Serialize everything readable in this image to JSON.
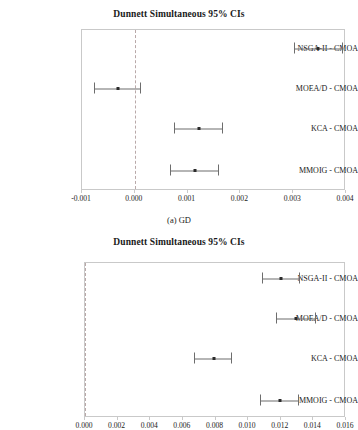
{
  "figures": [
    {
      "id": "gd",
      "title": "Dunnett Simultaneous 95% CIs",
      "caption": "(a) GD",
      "chart_data": {
        "type": "scatter",
        "title": "Dunnett Simultaneous 95% CIs",
        "xlabel": "",
        "ylabel": "",
        "xlim": [
          -0.001,
          0.004
        ],
        "xticks": [
          "-0.001",
          "0.000",
          "0.001",
          "0.002",
          "0.003",
          "0.004"
        ],
        "xtick_values": [
          -0.001,
          0.0,
          0.001,
          0.002,
          0.003,
          0.004
        ],
        "reference_line": 0.0,
        "grid": false,
        "legend": "none",
        "categories": [
          "NSGA-II - CMOA",
          "MOEA/D - CMOA",
          "KCA - CMOA",
          "MMOIG - CMOA"
        ],
        "points": [
          {
            "label": "NSGA-II - CMOA",
            "center": 0.00349,
            "lower": 0.00303,
            "upper": 0.00396
          },
          {
            "label": "MOEA/D - CMOA",
            "center": -0.00029,
            "lower": -0.00076,
            "upper": 0.00014
          },
          {
            "label": "KCA - CMOA",
            "center": 0.00124,
            "lower": 0.00077,
            "upper": 0.00169
          },
          {
            "label": "MMOIG - CMOA",
            "center": 0.00115,
            "lower": 0.00068,
            "upper": 0.00161
          }
        ]
      }
    },
    {
      "id": "second",
      "title": "Dunnett Simultaneous 95% CIs",
      "caption": "",
      "chart_data": {
        "type": "scatter",
        "title": "Dunnett Simultaneous 95% CIs",
        "xlabel": "",
        "ylabel": "",
        "xlim": [
          0.0,
          0.016
        ],
        "xticks": [
          "0.000",
          "0.002",
          "0.004",
          "0.006",
          "0.008",
          "0.010",
          "0.012",
          "0.014",
          "0.016"
        ],
        "xtick_values": [
          0.0,
          0.002,
          0.004,
          0.006,
          0.008,
          0.01,
          0.012,
          0.014,
          0.016
        ],
        "reference_line": 0.0,
        "grid": false,
        "legend": "none",
        "categories": [
          "NSGA-II - CMOA",
          "MOEA/D - CMOA",
          "KCA - CMOA",
          "MMOIG - CMOA"
        ],
        "points": [
          {
            "label": "NSGA-II - CMOA",
            "center": 0.01205,
            "lower": 0.0109,
            "upper": 0.01325
          },
          {
            "label": "MOEA/D - CMOA",
            "center": 0.013,
            "lower": 0.0118,
            "upper": 0.0142
          },
          {
            "label": "KCA - CMOA",
            "center": 0.00795,
            "lower": 0.00675,
            "upper": 0.0091
          },
          {
            "label": "MMOIG - CMOA",
            "center": 0.012,
            "lower": 0.0108,
            "upper": 0.01315
          }
        ]
      }
    }
  ],
  "colors": {
    "frame": "#c9c9c9",
    "reference_line": "#b9a9a9",
    "interval": "#6d6d6d",
    "marker": "#2b2b2b",
    "text": "#1a1a1a"
  }
}
